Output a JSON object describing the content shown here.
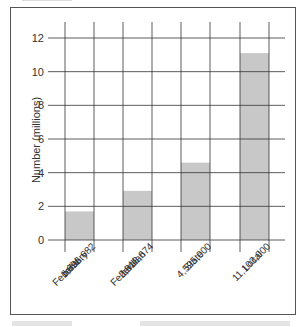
{
  "chart_data": {
    "type": "bar",
    "title": "",
    "xlabel": "",
    "ylabel": "Number (millions)",
    "ylim": [
      0,
      12
    ],
    "yticks": [
      0,
      2,
      4,
      6,
      8,
      10,
      12
    ],
    "grid": true,
    "categories": [
      {
        "lines": [
          "Federal",
          "military",
          "1,696,682"
        ]
      },
      {
        "lines": [
          "Federal",
          "civilian",
          "2,918,674"
        ]
      },
      {
        "lines": [
          "State",
          "4,595,000"
        ]
      },
      {
        "lines": [
          "Local",
          "11,103,000"
        ]
      }
    ],
    "values": [
      1.696682,
      2.918674,
      4.595,
      11.103
    ],
    "bar_color": "#c8c8c8",
    "grid_color": "#333333"
  }
}
